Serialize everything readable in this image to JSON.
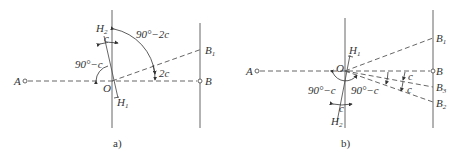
{
  "panels": [
    {
      "id": "a",
      "caption": "a)",
      "labels": {
        "A": "A",
        "B": "B",
        "B1_main": "B",
        "B1_sub": "1",
        "O": "O",
        "H1_main": "H",
        "H1_sub": "1",
        "H2_main": "H",
        "H2_sub": "2",
        "angle_c": "c",
        "angle_90_minus_c": "90°−c",
        "angle_90_minus_2c": "90°−2c",
        "angle_2c": "2c"
      }
    },
    {
      "id": "b",
      "caption": "b)",
      "labels": {
        "A": "A",
        "B": "B",
        "B1_main": "B",
        "B1_sub": "1",
        "B2_main": "B",
        "B2_sub": "2",
        "B3_main": "B",
        "B3_sub": "3",
        "O": "O",
        "H1_main": "H",
        "H1_sub": "1",
        "H2_main": "H",
        "H2_sub": "2",
        "angle_c_bottom": "c",
        "angle_90_minus_c_left": "90°−c",
        "angle_90_minus_c_right": "90°−c",
        "angle_c_upper_right": "c",
        "angle_c_lower_right": "c"
      }
    }
  ],
  "colors": {
    "line": "#555555",
    "text": "#333333",
    "background": "#ffffff"
  }
}
